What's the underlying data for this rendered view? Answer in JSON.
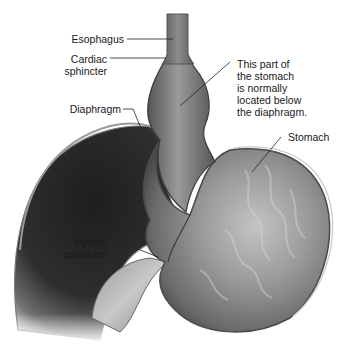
{
  "diagram": {
    "labels": {
      "esophagus": "Esophagus",
      "cardiac_sphincter": "Cardiac\nsphincter",
      "diaphragm": "Diaphragm",
      "hernia_note": "This part of\nthe stomach\nis normally\nlocated below\nthe diaphragm.",
      "stomach": "Stomach",
      "pyloric_sphincter": "Pyloric\nsphincter"
    },
    "colors": {
      "background": "#ffffff",
      "liver_dark": "#2a2a2a",
      "stomach_mid": "#8a8a8a",
      "stomach_light": "#b8b8b8",
      "outline": "#555555",
      "text": "#1a1a1a"
    }
  }
}
